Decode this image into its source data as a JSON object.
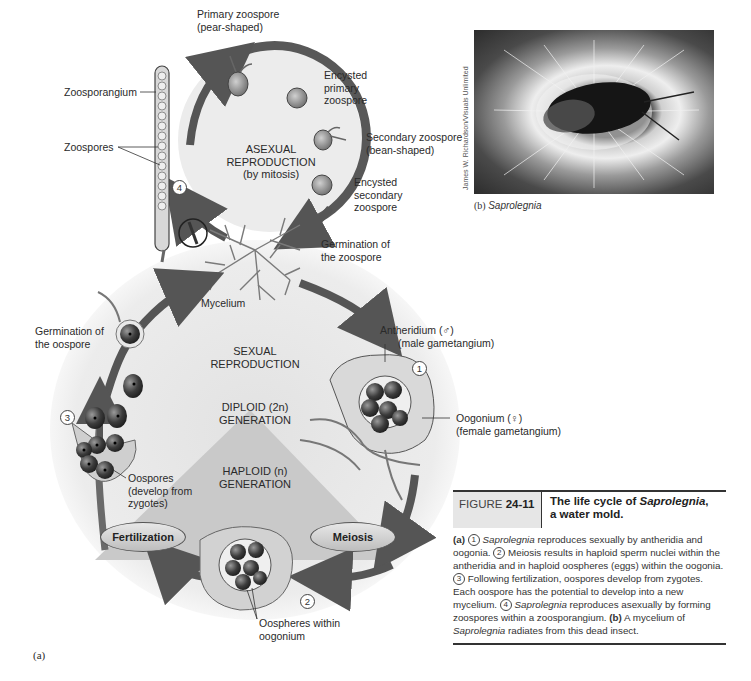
{
  "figure": {
    "number_prefix": "FIGURE",
    "number": "24-11",
    "title_part1": "The life cycle of ",
    "title_italic": "Saprolegnia",
    "title_part2": ",",
    "title_line2": "a water mold.",
    "panel_a_label": "(a)",
    "caption": {
      "a_label": "(a)",
      "s1_num": "1",
      "s1_italic": "Saprolegnia",
      "s1_text": " reproduces sexually by antheridia and oogonia.",
      "s2_num": "2",
      "s2_text": " Meiosis results in haploid sperm nuclei within the antheridia and in haploid oospheres (eggs) within the oogonia.",
      "s3_num": "3",
      "s3_text": " Following fertilization, oospores develop from zygotes. Each oospore has the potential to develop into a new mycelium.",
      "s4_num": "4",
      "s4_italic": "Saprolegnia",
      "s4_text": " reproduces asexually by forming zoospores within a zoosporangium.",
      "b_label": "(b)",
      "b_text1": " A mycelium of ",
      "b_italic": "Saprolegnia",
      "b_text2": " radiates from this dead insect."
    }
  },
  "photo": {
    "credit": "James W. Richardson/Visuals Unlimited",
    "caption_label": "(b)",
    "caption_italic": "Saprolegnia"
  },
  "asexual": {
    "title_line1": "ASEXUAL",
    "title_line2": "REPRODUCTION",
    "title_line3": "(by mitosis)",
    "labels": {
      "primary_zoospore_1": "Primary zoospore",
      "primary_zoospore_2": "(pear-shaped)",
      "encysted_primary_1": "Encysted",
      "encysted_primary_2": "primary",
      "encysted_primary_3": "zoospore",
      "secondary_zoospore_1": "Secondary zoospore",
      "secondary_zoospore_2": "(bean-shaped)",
      "encysted_secondary_1": "Encysted",
      "encysted_secondary_2": "secondary",
      "encysted_secondary_3": "zoospore",
      "germination_zoospore_1": "Germination of",
      "germination_zoospore_2": "the zoospore",
      "zoosporangium": "Zoosporangium",
      "zoospores": "Zoospores",
      "mycelium": "Mycelium"
    },
    "step_number": "4"
  },
  "sexual": {
    "title_line1": "SEXUAL",
    "title_line2": "REPRODUCTION",
    "diploid_line1": "DIPLOID (2n)",
    "diploid_line2": "GENERATION",
    "haploid_line1": "HAPLOID (n)",
    "haploid_line2": "GENERATION",
    "labels": {
      "antheridium_1": "Antheridium (♂)",
      "antheridium_2": "(male gametangium)",
      "oogonium_1": "Oogonium (♀)",
      "oogonium_2": "(female gametangium)",
      "oospheres_1": "Oospheres within",
      "oospheres_2": "oogonium",
      "oospores_1": "Oospores",
      "oospores_2": "(develop from",
      "oospores_3": "zygotes)",
      "germination_oospore_1": "Germination of",
      "germination_oospore_2": "the oospore"
    },
    "fertilization": "Fertilization",
    "meiosis": "Meiosis",
    "step_numbers": [
      "1",
      "2",
      "3"
    ]
  },
  "colors": {
    "arrow": "#555555",
    "cycle_bg": "#e4e4e4",
    "haploid_triangle": "#c8c8c8",
    "cell_dark": "#3a3a3a",
    "text": "#222222"
  }
}
